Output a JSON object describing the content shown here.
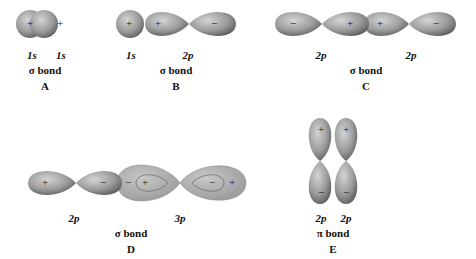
{
  "diagrams": [
    {
      "id": "A",
      "bond": "σ bond",
      "orbitals": [
        "1s",
        "1s"
      ],
      "signs": [
        "+",
        "+"
      ]
    },
    {
      "id": "B",
      "bond": "σ bond",
      "orbitals": [
        "1s",
        "2p"
      ],
      "signs": [
        "+",
        "+",
        "−"
      ]
    },
    {
      "id": "C",
      "bond": "σ bond",
      "orbitals": [
        "2p",
        "2p"
      ],
      "signs": [
        "−",
        "+",
        "+",
        "−"
      ]
    },
    {
      "id": "D",
      "bond": "σ bond",
      "orbitals": [
        "2p",
        "3p"
      ],
      "signs": [
        "+",
        "−",
        "−",
        "+",
        "−",
        "+"
      ]
    },
    {
      "id": "E",
      "bond": "π bond",
      "orbitals": [
        "2p",
        "2p"
      ],
      "signs": [
        "+",
        "+",
        "−",
        "−"
      ]
    }
  ],
  "colors": {
    "lobe": "#9a9a9a",
    "lobe_light": "#cfcfcf",
    "lobe_dark": "#555555",
    "outline": "#777777"
  }
}
